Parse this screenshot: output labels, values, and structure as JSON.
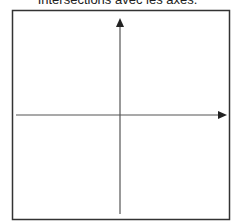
{
  "title": "Intersections avec les axes.",
  "diagram": {
    "type": "coordinate-axes",
    "colors": {
      "frame": "#333333",
      "axes": "#555555",
      "background": "#ffffff"
    },
    "axes": [
      {
        "name": "x-axis",
        "direction": "right",
        "arrowhead": true
      },
      {
        "name": "y-axis",
        "direction": "up",
        "arrowhead": true
      }
    ]
  }
}
